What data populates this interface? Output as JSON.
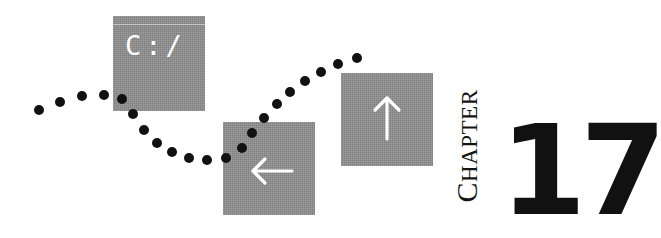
{
  "chapter_opener": {
    "chapter_word_initial": "C",
    "chapter_word_rest": "HAPTER",
    "chapter_number": "17"
  },
  "tiles": [
    {
      "name": "c-drive-tile",
      "label": "C:/",
      "icon": "text"
    },
    {
      "name": "left-arrow-tile",
      "label": "",
      "icon": "arrow-left-icon"
    },
    {
      "name": "up-arrow-tile",
      "label": "",
      "icon": "arrow-up-icon"
    }
  ],
  "colors": {
    "tile_gray": "#8e8e8e",
    "dot": "#111111",
    "text": "#111111",
    "background": "#ffffff"
  },
  "dotted_path": {
    "dot_radius": 5,
    "points": [
      [
        39,
        110
      ],
      [
        60,
        102
      ],
      [
        82,
        96
      ],
      [
        104,
        95
      ],
      [
        122,
        99
      ],
      [
        133,
        114
      ],
      [
        144,
        130
      ],
      [
        157,
        143
      ],
      [
        172,
        152
      ],
      [
        189,
        158
      ],
      [
        207,
        160
      ],
      [
        226,
        158
      ],
      [
        242,
        148
      ],
      [
        252,
        133
      ],
      [
        264,
        118
      ],
      [
        277,
        104
      ],
      [
        290,
        92
      ],
      [
        305,
        81
      ],
      [
        321,
        72
      ],
      [
        338,
        64
      ],
      [
        357,
        58
      ]
    ]
  }
}
